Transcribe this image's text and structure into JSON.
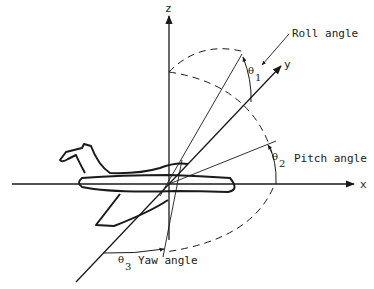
{
  "diagram": {
    "axes": {
      "x_label": "x",
      "y_label": "y",
      "z_label": "z"
    },
    "angles": {
      "roll": {
        "symbol": "θ",
        "subscript": "1",
        "label": "Roll angle"
      },
      "pitch": {
        "symbol": "θ",
        "subscript": "2",
        "label": "Pitch angle"
      },
      "yaw": {
        "symbol": "θ",
        "subscript": "3",
        "label": "Yaw angle"
      }
    },
    "colors": {
      "ink": "#1a1a1a",
      "background": "#ffffff"
    }
  }
}
